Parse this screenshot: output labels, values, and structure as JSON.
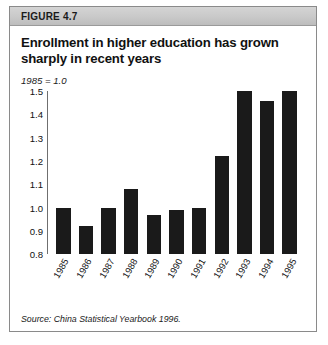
{
  "figure": {
    "label": "FIGURE 4.7",
    "title": "Enrollment in higher education has grown sharply in recent years",
    "subtitle": "1985 = 1.0",
    "source": "Source: China Statistical Yearbook 1996."
  },
  "chart_data": {
    "type": "bar",
    "title": "Enrollment in higher education has grown sharply in recent years",
    "subtitle": "1985 = 1.0",
    "xlabel": "",
    "ylabel": "",
    "ylim": [
      0.8,
      1.5
    ],
    "yticks": [
      0.8,
      0.9,
      1.0,
      1.1,
      1.2,
      1.3,
      1.4,
      1.5
    ],
    "ytick_labels": [
      "0.8",
      "0.9",
      "1.0",
      "1.1",
      "1.2",
      "1.3",
      "1.4",
      "1.5"
    ],
    "grid": false,
    "legend": false,
    "bar_color": "#1a1a1a",
    "categories": [
      "1985",
      "1986",
      "1987",
      "1988",
      "1989",
      "1990",
      "1991",
      "1992",
      "1993",
      "1994",
      "1995"
    ],
    "values": [
      1.0,
      0.92,
      1.0,
      1.08,
      0.97,
      0.99,
      1.0,
      1.22,
      1.5,
      1.46,
      1.5
    ],
    "source": "Source: China Statistical Yearbook 1996."
  }
}
